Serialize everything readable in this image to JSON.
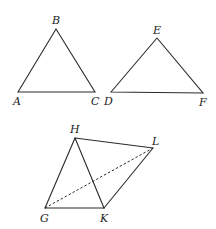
{
  "figures": [
    {
      "name": "triangle-abc",
      "vertices": [
        {
          "label": "A",
          "x": 18,
          "y": 92,
          "lx": 14,
          "ly": 105
        },
        {
          "label": "B",
          "x": 56,
          "y": 29,
          "lx": 52,
          "ly": 24
        },
        {
          "label": "C",
          "x": 95,
          "y": 92,
          "lx": 91,
          "ly": 105
        }
      ]
    },
    {
      "name": "triangle-def",
      "vertices": [
        {
          "label": "D",
          "x": 111,
          "y": 92,
          "lx": 104,
          "ly": 105
        },
        {
          "label": "E",
          "x": 157,
          "y": 38,
          "lx": 153,
          "ly": 34
        },
        {
          "label": "F",
          "x": 203,
          "y": 93,
          "lx": 199,
          "ly": 106
        }
      ]
    },
    {
      "name": "quadrilateral-ghlk",
      "vertices": [
        {
          "label": "G",
          "x": 45,
          "y": 208,
          "lx": 40,
          "ly": 222
        },
        {
          "label": "H",
          "x": 75,
          "y": 138,
          "lx": 70,
          "ly": 133
        },
        {
          "label": "L",
          "x": 153,
          "y": 148,
          "lx": 152,
          "ly": 145
        },
        {
          "label": "K",
          "x": 104,
          "y": 208,
          "lx": 100,
          "ly": 222
        }
      ],
      "solid_edges": [
        [
          "G",
          "H"
        ],
        [
          "H",
          "L"
        ],
        [
          "L",
          "K"
        ],
        [
          "K",
          "G"
        ],
        [
          "H",
          "K"
        ]
      ],
      "dashed_edges": [
        [
          "G",
          "L"
        ]
      ]
    }
  ],
  "labels": {
    "A": "A",
    "B": "B",
    "C": "C",
    "D": "D",
    "E": "E",
    "F": "F",
    "G": "G",
    "H": "H",
    "K": "K",
    "L": "L"
  }
}
